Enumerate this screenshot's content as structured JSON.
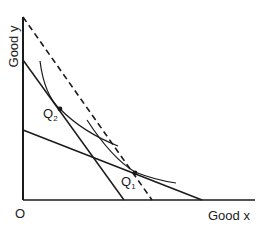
{
  "diagram": {
    "type": "indifference-curve-budget-lines",
    "axes": {
      "y_label": "Good y",
      "x_label": "Good x",
      "origin_label": "O"
    },
    "points": [
      {
        "id": "Q2",
        "label": "Q",
        "subscript": "2"
      },
      {
        "id": "Q1",
        "label": "Q",
        "subscript": "1"
      }
    ],
    "lines": [
      {
        "id": "budget-steep",
        "style": "solid"
      },
      {
        "id": "budget-shallow",
        "style": "solid"
      },
      {
        "id": "budget-dashed",
        "style": "dashed"
      }
    ],
    "curves": [
      {
        "id": "indifference-curve-upper",
        "through": "Q2"
      },
      {
        "id": "indifference-curve-lower",
        "through": "Q1"
      }
    ],
    "colors": {
      "ink": "#1a1a1a",
      "background": "#ffffff"
    }
  }
}
